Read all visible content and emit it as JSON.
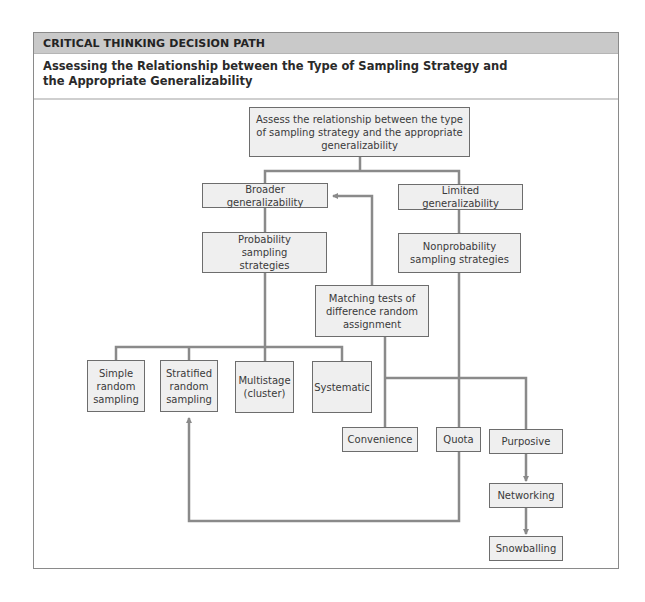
{
  "header": {
    "label": "CRITICAL THINKING DECISION PATH",
    "background_color": "#c9c9c9"
  },
  "subtitle": {
    "line1": "Assessing the Relationship between the Type of Sampling Strategy and",
    "line2": "the Appropriate Generalizability"
  },
  "diagram": {
    "line_color": "#8a8a8a",
    "node_fill": "#efefef",
    "nodes": {
      "root": "Assess the relationship between the type of sampling strategy and the appropriate generalizability",
      "broader": "Broader generalizability",
      "limited": "Limited generalizability",
      "probability": "Probability sampling strategies",
      "nonprobability": "Nonprobability sampling strategies",
      "matching": "Matching tests of difference random assignment",
      "simple_random": "Simple random sampling",
      "stratified_random": "Stratified random sampling",
      "multistage": "Multistage (cluster)",
      "systematic": "Systematic",
      "convenience": "Convenience",
      "quota": "Quota",
      "purposive": "Purposive",
      "networking": "Networking",
      "snowballing": "Snowballing"
    },
    "edges": [
      {
        "from": "root",
        "to": "broader"
      },
      {
        "from": "root",
        "to": "limited"
      },
      {
        "from": "broader",
        "to": "probability"
      },
      {
        "from": "limited",
        "to": "nonprobability"
      },
      {
        "from": "probability",
        "to": "simple_random"
      },
      {
        "from": "probability",
        "to": "stratified_random"
      },
      {
        "from": "probability",
        "to": "multistage"
      },
      {
        "from": "probability",
        "to": "systematic"
      },
      {
        "from": "matching",
        "to": "broader",
        "arrow": true
      },
      {
        "from": "matching",
        "to": "convenience"
      },
      {
        "from": "nonprobability",
        "to": "quota"
      },
      {
        "from": "nonprobability",
        "to": "purposive"
      },
      {
        "from": "quota",
        "to": "stratified_random",
        "arrow": true
      },
      {
        "from": "purposive",
        "to": "networking",
        "arrow": true
      },
      {
        "from": "networking",
        "to": "snowballing",
        "arrow": true
      }
    ]
  }
}
